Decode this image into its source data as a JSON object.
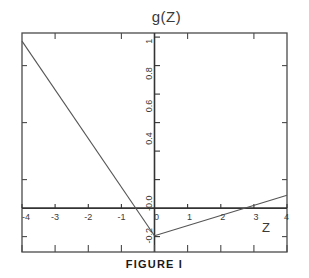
{
  "figure": {
    "caption": "FIGURE  I",
    "title": "g(Z)"
  },
  "axis_label_x": "Z",
  "chart_data": {
    "type": "line",
    "title": "g(Z)",
    "xlabel": "Z",
    "ylabel": "g(Z)",
    "xlim": [
      -4,
      4
    ],
    "ylim": [
      -0.3,
      1.05
    ],
    "grid": false,
    "legend": "none",
    "xticks": [
      -4,
      -3,
      -2,
      -1,
      0,
      1,
      2,
      3,
      4
    ],
    "xticklabels": [
      "-4",
      "-3",
      "-2",
      "-1",
      "0",
      "1",
      "2",
      "3",
      "4"
    ],
    "yticks": [
      1.0,
      0.8,
      0.6,
      0.4,
      0.2,
      0.0,
      -0.2
    ],
    "yticklabels": [
      "1.0",
      "0.8",
      "0.6",
      "0.4",
      "0.2",
      "-0.0",
      "-0.2"
    ],
    "ytick_labels_shown": [
      "1.0",
      "0.8",
      "0.6",
      "0.4",
      "-0.0",
      "-0.2"
    ],
    "tick_label_rotation": 90,
    "series": [
      {
        "name": "left-branch",
        "x": [
          -4,
          0
        ],
        "y": [
          1.0,
          -0.2
        ]
      },
      {
        "name": "right-branch",
        "x": [
          0,
          4
        ],
        "y": [
          -0.2,
          0.05
        ]
      }
    ],
    "zero_line_y": 0.0,
    "zero_line_x": 0.0,
    "annotations": []
  }
}
